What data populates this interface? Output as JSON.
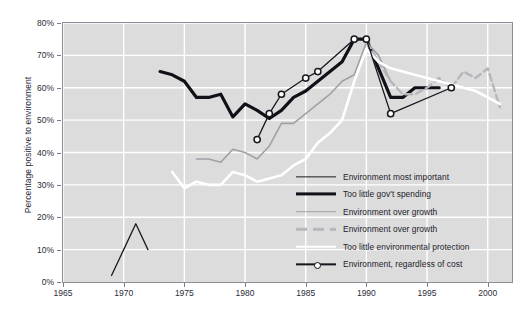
{
  "chart_data": {
    "type": "line",
    "title": "",
    "xlabel": "",
    "ylabel": "Percentage positive to environment",
    "xlim": [
      1965,
      2002
    ],
    "ylim": [
      0,
      80
    ],
    "yticks": [
      0,
      10,
      20,
      30,
      40,
      50,
      60,
      70,
      80
    ],
    "ytick_labels": [
      "0%",
      "10%",
      "20%",
      "30%",
      "40%",
      "50%",
      "60%",
      "70%",
      "80%"
    ],
    "xticks": [
      1965,
      1970,
      1975,
      1980,
      1985,
      1990,
      1995,
      2000
    ],
    "xtick_labels": [
      "1965",
      "1970",
      "1975",
      "1980",
      "1985",
      "1990",
      "1995",
      "2000"
    ],
    "grid": true,
    "grid_color": "#ffffff",
    "plot_background": "#dcdcdd",
    "legend_position": "inside-lower-right",
    "series": [
      {
        "name": "Environment most important",
        "color": "#1b1b22",
        "width": 1.3,
        "style": "solid",
        "marker": "none",
        "x": [
          1969,
          1970,
          1971,
          1972
        ],
        "values": [
          2,
          10,
          18,
          10
        ]
      },
      {
        "name": "Too little gov't spending",
        "color": "#101018",
        "width": 3.2,
        "style": "solid",
        "marker": "none",
        "x": [
          1973,
          1974,
          1975,
          1976,
          1977,
          1978,
          1979,
          1980,
          1981,
          1982,
          1983,
          1984,
          1985,
          1986,
          1987,
          1988,
          1989,
          1990,
          1991,
          1992,
          1993,
          1994,
          1995,
          1996
        ],
        "values": [
          65,
          64,
          62,
          57,
          57,
          58,
          51,
          55,
          53,
          50.5,
          53,
          57,
          59,
          62,
          65,
          68,
          75,
          75,
          66,
          57,
          57,
          60,
          60,
          60
        ]
      },
      {
        "name": "Environment over growth",
        "color": "#a0a0a8",
        "width": 1.6,
        "style": "solid",
        "marker": "none",
        "x": [
          1976,
          1977,
          1978,
          1979,
          1980,
          1981,
          1982,
          1983,
          1984,
          1985,
          1986,
          1987,
          1988,
          1989,
          1990,
          1991,
          1992
        ],
        "values": [
          38,
          38,
          37,
          41,
          40,
          38,
          42,
          49,
          49,
          52,
          55,
          58,
          62,
          64,
          74,
          70,
          62
        ]
      },
      {
        "name": "Environment over growth",
        "color": "#b6b6bd",
        "width": 2.4,
        "style": "dashed",
        "marker": "none",
        "x": [
          1990,
          1991,
          1992,
          1993,
          1994,
          1995,
          1996,
          1997,
          1998,
          1999,
          2000,
          2001
        ],
        "values": [
          74,
          68,
          62,
          58,
          58,
          60,
          63,
          60,
          65,
          63,
          66,
          54
        ]
      },
      {
        "name": "Too little environmental protection",
        "color": "#ffffff",
        "width": 2.6,
        "style": "solid",
        "marker": "none",
        "x": [
          1974,
          1975,
          1976,
          1977,
          1978,
          1979,
          1980,
          1981,
          1982,
          1983,
          1984,
          1985,
          1986,
          1987,
          1988,
          1989,
          1990,
          1991,
          1992,
          1993,
          1994,
          1995,
          1996,
          1997,
          1998,
          1999,
          2000,
          2001
        ],
        "values": [
          34,
          29,
          31,
          30,
          30,
          34,
          33,
          31,
          32,
          33,
          36,
          38,
          43,
          46,
          50,
          62,
          72,
          68,
          66,
          65,
          64,
          63,
          62,
          61,
          60,
          59,
          57,
          55
        ]
      },
      {
        "name": "Environment, regardless of cost",
        "color": "#16161d",
        "width": 1.3,
        "style": "solid",
        "marker": "circle",
        "x": [
          1981,
          1982,
          1983,
          1985,
          1986,
          1989,
          1990,
          1992,
          1997
        ],
        "values": [
          44,
          52,
          58,
          63,
          65,
          75,
          75,
          52,
          60
        ]
      }
    ]
  },
  "legend": {
    "items": [
      {
        "label": "Environment most important",
        "swatch": "thin-black-line"
      },
      {
        "label": "Too little gov't spending",
        "swatch": "thick-black-line"
      },
      {
        "label": "Environment over growth",
        "swatch": "gray-line"
      },
      {
        "label": "Environment over growth",
        "swatch": "gray-dashed-line"
      },
      {
        "label": "Too little environmental protection",
        "swatch": "white-line"
      },
      {
        "label": "Environment, regardless of cost",
        "swatch": "black-line-circle-marker"
      }
    ]
  }
}
